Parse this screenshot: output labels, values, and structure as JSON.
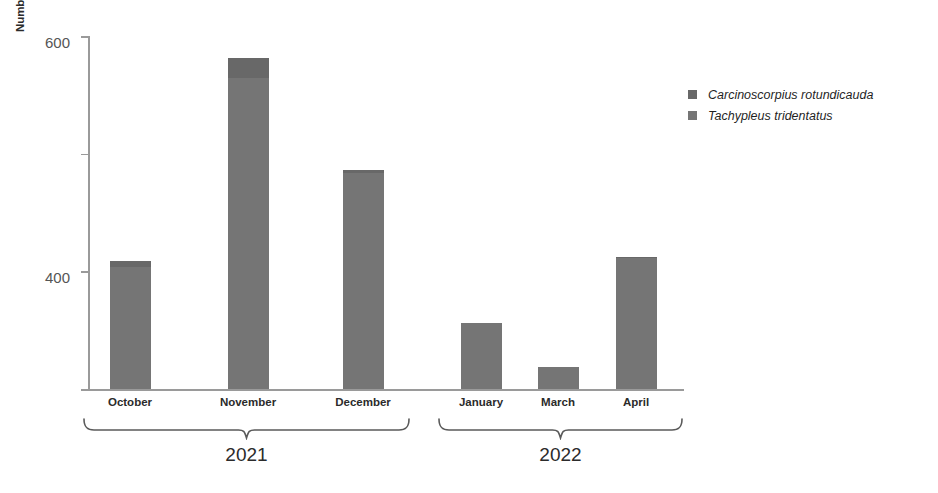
{
  "chart_data": {
    "type": "bar",
    "title": "",
    "subtitle": "",
    "xlabel": "",
    "ylabel": "Number of bycaught individuals",
    "ylim": [
      0,
      600
    ],
    "yticks": [
      0,
      200,
      400,
      600
    ],
    "ytick_labels": [
      "0",
      "200",
      "400",
      "600"
    ],
    "grid": false,
    "stacked": true,
    "legend_position": "right",
    "categories": [
      "October",
      "November",
      "December",
      "January",
      "March",
      "April"
    ],
    "groups": [
      {
        "label": "2021",
        "categories": [
          "October",
          "November",
          "December"
        ]
      },
      {
        "label": "2022",
        "categories": [
          "January",
          "March",
          "April"
        ]
      }
    ],
    "series": [
      {
        "name": "Tachypleus tridentatus",
        "color": "#757575",
        "values": [
          208,
          528,
          367,
          112,
          38,
          222
        ]
      },
      {
        "name": "Carcinoscorpius rotundicauda",
        "color": "#686868",
        "values": [
          10,
          35,
          5,
          0,
          0,
          3
        ]
      }
    ],
    "totals": [
      218,
      563,
      372,
      112,
      38,
      225
    ]
  },
  "axis": {
    "y_title": "Number of bycaught individuals",
    "y_tick_labels": [
      "600",
      "400",
      "200",
      "0"
    ]
  },
  "months": [
    {
      "label": "October"
    },
    {
      "label": "November"
    },
    {
      "label": "December"
    },
    {
      "label": "January"
    },
    {
      "label": "March"
    },
    {
      "label": "April"
    }
  ],
  "year_groups": [
    {
      "label": "2021"
    },
    {
      "label": "2022"
    }
  ],
  "legend": {
    "items": [
      {
        "label": "Carcinoscorpius rotundicauda",
        "color": "#686868"
      },
      {
        "label": "Tachypleus tridentatus",
        "color": "#757575"
      }
    ]
  }
}
